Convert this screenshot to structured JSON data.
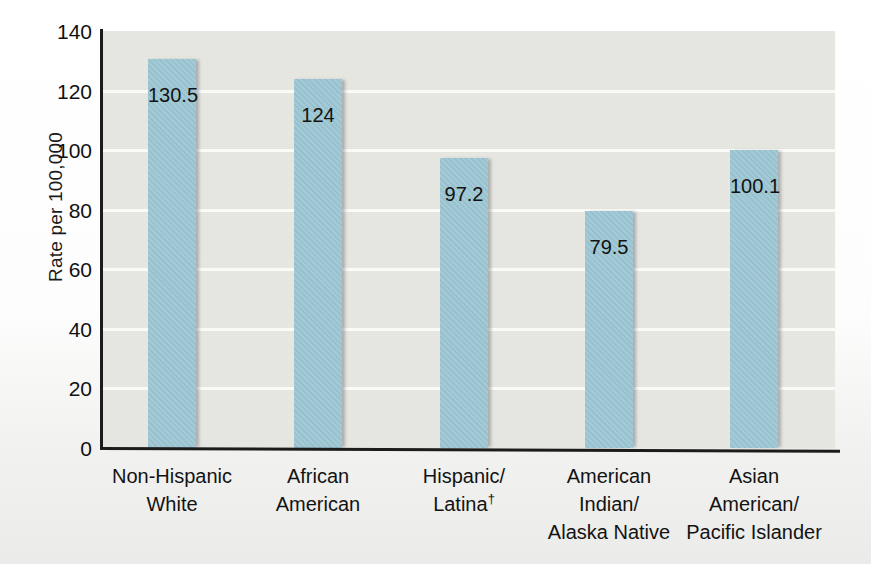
{
  "chart_data": {
    "type": "bar",
    "title": "",
    "xlabel": "",
    "ylabel": "Rate per 100,000",
    "ylim": [
      0,
      140
    ],
    "yticks": [
      0,
      20,
      40,
      60,
      80,
      100,
      120,
      140
    ],
    "ytick_labels": [
      "0",
      "20",
      "40",
      "60",
      "80",
      "100",
      "120",
      "140"
    ],
    "grid": true,
    "grid_axis": "y",
    "legend": "none",
    "categories": [
      "Non-Hispanic White",
      "African American",
      "Hispanic/Latina†",
      "American Indian/Alaska Native",
      "Asian American/Pacific Islander"
    ],
    "category_lines": [
      [
        "Non-Hispanic",
        "White"
      ],
      [
        "African",
        "American"
      ],
      [
        "Hispanic/",
        "Latina†"
      ],
      [
        "American",
        "Indian/",
        "Alaska Native"
      ],
      [
        "Asian",
        "American/",
        "Pacific Islander"
      ]
    ],
    "values": [
      130.5,
      124,
      97.2,
      79.5,
      100.1
    ],
    "value_labels": [
      "130.5",
      "124",
      "97.2",
      "79.5",
      "100.1"
    ],
    "bar_color": "#9cc6d3",
    "plot_background": "#e8e8e3",
    "gridline_color": "#fafaf7",
    "axis_color": "#1c1c1c",
    "text_color": "#121212",
    "annotations": {
      "dagger_marker": "†"
    }
  }
}
